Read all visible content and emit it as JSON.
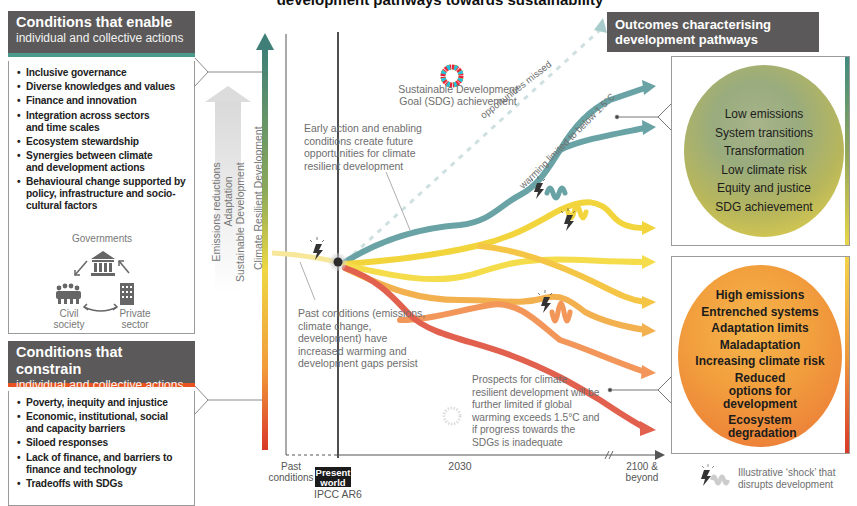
{
  "title": "development pathways towards sustainability",
  "enable_panel": {
    "heading": "Conditions that enable",
    "subheading": "individual and collective actions",
    "accent_color": "#4c9a8e",
    "items": [
      "Inclusive governance",
      "Diverse knowledges and values",
      "Finance and innovation",
      "Integration across sectors and time scales",
      "Ecosystem stewardship",
      "Synergies between climate and development actions",
      "Behavioural change supported by policy, infrastructure and socio-cultural factors"
    ],
    "actors": {
      "governments": "Governments",
      "civil_society": "Civil society",
      "private_sector": "Private sector"
    }
  },
  "constrain_panel": {
    "heading": "Conditions that constrain",
    "subheading": "individual and collective actions",
    "accent_color": "#e8531f",
    "items": [
      "Poverty, inequity and injustice",
      "Economic, institutional, social and capacity barriers",
      "Siloed responses",
      "Lack of finance, and barriers to finance and technology",
      "Tradeoffs with SDGs"
    ]
  },
  "vertical_labels": {
    "arrow_labels": [
      "Emissions reductions",
      "Adaptation",
      "Sustainable Development"
    ],
    "axis_label": "Climate Resilient Development"
  },
  "annotations": {
    "sdg": "Sustainable Development Goal (SDG) achievement",
    "early_action": "Early action and enabling conditions create future opportunities for climate resilient development",
    "opportunities_missed": "opportunities missed",
    "warming_limited": "warming limited to below 1.5°C",
    "past_conditions": "Past conditions (emissions, climate change, development) have increased warming and development gaps persist",
    "prospects": "Prospects for climate resilient development will be further limited if global warming exceeds 1.5°C and if progress towards the SDGs is inadequate"
  },
  "timeline": {
    "past": "Past conditions",
    "present_line1": "Present",
    "present_line2": "world",
    "present_sub": "IPCC AR6",
    "mid": "2030",
    "end": "2100 & beyond"
  },
  "outcomes": {
    "heading": "Outcomes characterising development pathways",
    "good": [
      "Low emissions",
      "System transitions",
      "Transformation",
      "Low climate risk",
      "Equity and justice",
      "SDG achievement"
    ],
    "bad": [
      "High emissions",
      "Entrenched systems",
      "Adaptation limits",
      "Maladaptation",
      "Increasing climate risk",
      "Reduced options for development",
      "Ecosystem degradation"
    ]
  },
  "legend": {
    "shock": "Illustrative ‘shock’ that disrupts development"
  },
  "colors": {
    "panel_header": "#5b5959",
    "teal_path": "#5c9ea0",
    "yellow_path": "#f2d53c",
    "orange_path": "#f2a24a",
    "red_path": "#e25a4a"
  }
}
